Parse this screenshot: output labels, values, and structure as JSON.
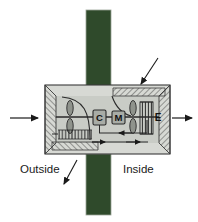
{
  "figure": {
    "background_color": "#ffffff"
  },
  "colors": {
    "wall_green": "#2f4a2b",
    "housing_fill": "#d7d9d4",
    "housing_stroke": "#3a3a3a",
    "inner_fill": "#c9ccc6",
    "line": "#222222",
    "component_fill": "#a8aca6",
    "text": "#1a1a1a"
  },
  "labels": {
    "outside": "Outside",
    "inside": "Inside"
  },
  "components": [
    {
      "id": "controller",
      "letter": "C",
      "name": "controller-box"
    },
    {
      "id": "motor",
      "letter": "M",
      "name": "motor-box"
    },
    {
      "id": "exchanger",
      "letter": "E",
      "name": "exchanger-label"
    }
  ],
  "flow": {
    "intake_arrow": "arrow-right",
    "exhaust_arrow": "arrow-right",
    "internal_supply": "arrow-right",
    "internal_return": "arrow-left"
  },
  "annotations": [
    {
      "id": "leader-top-right",
      "name": "leader-arrow-top-right",
      "direction": "down-left"
    },
    {
      "id": "leader-bottom-left",
      "name": "leader-arrow-bottom-left",
      "direction": "down-left"
    }
  ]
}
